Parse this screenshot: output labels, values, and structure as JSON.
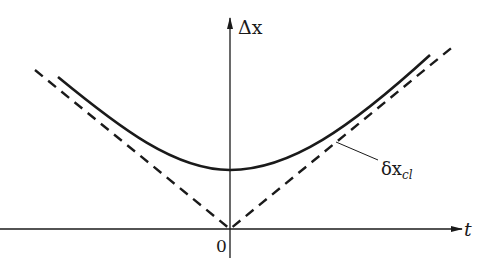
{
  "diagram": {
    "axes": {
      "y_label": "Δx",
      "x_label": "t",
      "origin_label": "0"
    },
    "curves": [
      {
        "name": "uncertainty-curve",
        "style": "solid",
        "shape": "hyperbola",
        "minimum_at": "t=0"
      },
      {
        "name": "classical-spread",
        "style": "dashed",
        "shape": "V (|t|)",
        "label": "δx",
        "label_subscript": "cl"
      }
    ]
  },
  "colors": {
    "stroke": "#1a1a1a",
    "background": "#ffffff"
  }
}
